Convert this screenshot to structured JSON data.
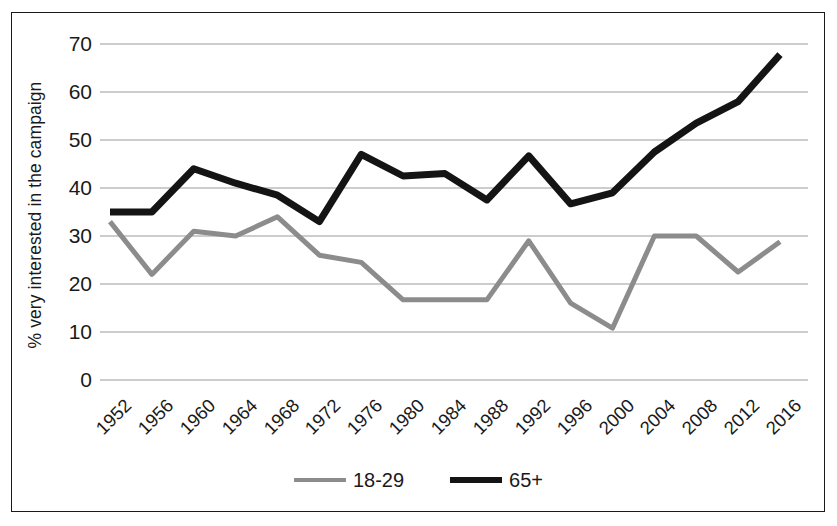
{
  "chart_data": {
    "type": "line",
    "title": "",
    "xlabel": "",
    "ylabel": "% very interested in the campaign",
    "ylim": [
      0,
      70
    ],
    "yticks": [
      0,
      10,
      20,
      30,
      40,
      50,
      60,
      70
    ],
    "grid": true,
    "legend_position": "bottom",
    "categories": [
      "1952",
      "1956",
      "1960",
      "1964",
      "1968",
      "1972",
      "1976",
      "1980",
      "1984",
      "1988",
      "1992",
      "1996",
      "2000",
      "2004",
      "2008",
      "2012",
      "2016"
    ],
    "series": [
      {
        "name": "18-29",
        "color": "#8c8c8c",
        "width": 5,
        "values": [
          33,
          22,
          31,
          30,
          34,
          26,
          24.5,
          16.7,
          16.7,
          16.7,
          29,
          16,
          10.8,
          30,
          30,
          22.5,
          28.8
        ]
      },
      {
        "name": "65+",
        "color": "#141414",
        "width": 7,
        "values": [
          35,
          35,
          44,
          41,
          38.5,
          33,
          47,
          42.5,
          43,
          37.5,
          46.7,
          36.7,
          39,
          47.5,
          53.5,
          58,
          67.8
        ]
      }
    ]
  },
  "axis": {
    "y_title": "% very interested in the campaign",
    "y_tick_labels": [
      "70",
      "60",
      "50",
      "40",
      "30",
      "20",
      "10",
      "0"
    ],
    "x_tick_labels": [
      "1952",
      "1956",
      "1960",
      "1964",
      "1968",
      "1972",
      "1976",
      "1980",
      "1984",
      "1988",
      "1992",
      "1996",
      "2000",
      "2004",
      "2008",
      "2012",
      "2016"
    ]
  },
  "legend": {
    "items": [
      {
        "label": "18-29",
        "color": "#8c8c8c"
      },
      {
        "label": "65+",
        "color": "#141414"
      }
    ]
  },
  "colors": {
    "young_series": "#8c8c8c",
    "old_series": "#141414",
    "gridline": "#9a9a9a",
    "frame": "#1a1a1a",
    "background": "#ffffff"
  }
}
